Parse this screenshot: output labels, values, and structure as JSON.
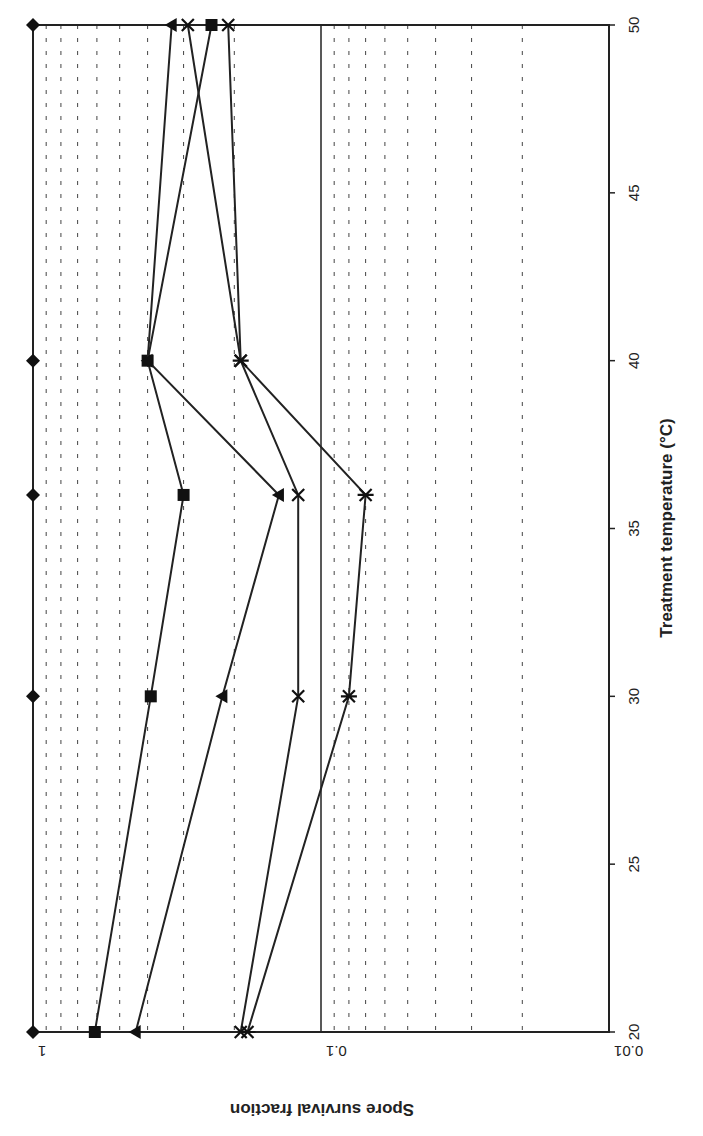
{
  "chart_data": {
    "type": "line",
    "orientation": "rotated-90-clockwise",
    "title": "",
    "xlabel": "Treatment temperature (°C)",
    "ylabel": "Spore survival fraction",
    "x_ticks": [
      "20",
      "25",
      "30",
      "35",
      "40",
      "45",
      "50"
    ],
    "y_ticks": [
      "1",
      "0.1",
      "0.01"
    ],
    "xlim": [
      20,
      50
    ],
    "ylim": [
      0.01,
      1
    ],
    "y_scale": "log",
    "grid": "dashed minor log gridlines, solid line at 0.1",
    "legend": null,
    "x": [
      20,
      30,
      36,
      40,
      50
    ],
    "series": [
      {
        "name": "diamond",
        "marker": "diamond",
        "values": [
          1.0,
          1.0,
          1.0,
          1.0,
          1.0
        ]
      },
      {
        "name": "square",
        "marker": "square",
        "values": [
          0.61,
          0.39,
          0.3,
          0.4,
          0.24
        ]
      },
      {
        "name": "triangle",
        "marker": "triangle",
        "values": [
          0.44,
          0.22,
          0.14,
          0.4,
          0.33
        ]
      },
      {
        "name": "cross",
        "marker": "x",
        "values": [
          0.19,
          0.12,
          0.12,
          0.19,
          0.29
        ]
      },
      {
        "name": "star",
        "marker": "asterisk",
        "values": [
          0.18,
          0.08,
          0.07,
          0.19,
          0.21
        ]
      }
    ]
  }
}
